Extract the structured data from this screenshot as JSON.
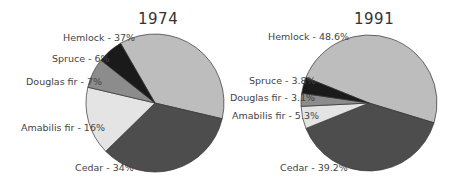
{
  "chart_data": [
    {
      "type": "pie",
      "title": "1974",
      "categories": [
        "Hemlock",
        "Cedar",
        "Amabilis fir",
        "Douglas fir",
        "Spruce"
      ],
      "values": [
        37,
        34,
        16,
        7,
        6
      ],
      "unit": "%",
      "labels": [
        "Hemlock - 37%",
        "Cedar - 34%",
        "Amabilis fir - 16%",
        "Douglas fir - 7%",
        "Spruce - 6%"
      ],
      "colors": [
        "#bdbdbd",
        "#4d4d4d",
        "#e4e4e4",
        "#8c8c8c",
        "#1a1a1a"
      ]
    },
    {
      "type": "pie",
      "title": "1991",
      "categories": [
        "Hemlock",
        "Cedar",
        "Amabilis fir",
        "Douglas fir",
        "Spruce"
      ],
      "values": [
        48.6,
        39.2,
        5.3,
        3.1,
        3.8
      ],
      "unit": "%",
      "labels": [
        "Hemlock - 48.6%",
        "Cedar - 39.2%",
        "Amabilis fir - 5.3%",
        "Douglas fir - 3.1%",
        "Spruce - 3.8%"
      ],
      "colors": [
        "#bdbdbd",
        "#4d4d4d",
        "#e4e4e4",
        "#8c8c8c",
        "#1a1a1a"
      ]
    }
  ]
}
